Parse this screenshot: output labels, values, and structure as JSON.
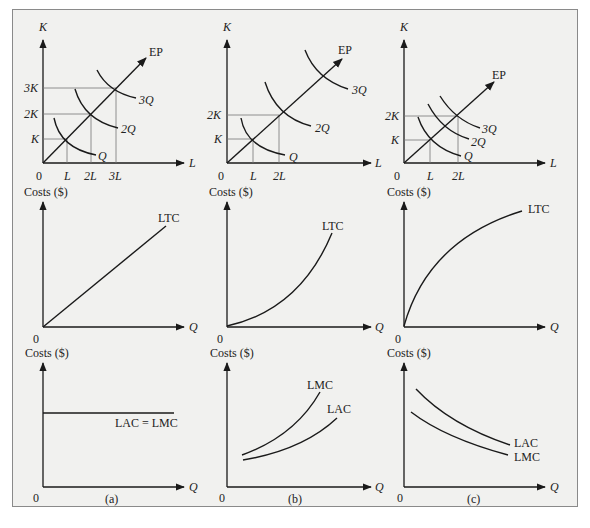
{
  "figure": {
    "panels": [
      {
        "id": "a",
        "caption": "(a)",
        "isoquant": {
          "y_axis": "K",
          "x_axis": "L",
          "origin": "0",
          "expansion_path": "EP",
          "isoquants": [
            "Q",
            "2Q",
            "3Q"
          ],
          "k_ticks": [
            "K",
            "2K",
            "3K"
          ],
          "l_ticks": [
            "L",
            "2L",
            "3L"
          ]
        },
        "ltc": {
          "y_axis": "Costs ($)",
          "x_axis": "Q",
          "origin": "0",
          "curve": "LTC"
        },
        "unit_cost": {
          "y_axis": "Costs ($)",
          "x_axis": "Q",
          "origin": "0",
          "curve": "LAC = LMC"
        }
      },
      {
        "id": "b",
        "caption": "(b)",
        "isoquant": {
          "y_axis": "K",
          "x_axis": "L",
          "origin": "0",
          "expansion_path": "EP",
          "isoquants": [
            "Q",
            "2Q",
            "3Q"
          ],
          "k_ticks": [
            "K",
            "2K"
          ],
          "l_ticks": [
            "L",
            "2L"
          ]
        },
        "ltc": {
          "y_axis": "Costs ($)",
          "x_axis": "Q",
          "origin": "0",
          "curve": "LTC"
        },
        "unit_cost": {
          "y_axis": "Costs ($)",
          "x_axis": "Q",
          "origin": "0",
          "curves": [
            "LMC",
            "LAC"
          ]
        }
      },
      {
        "id": "c",
        "caption": "(c)",
        "isoquant": {
          "y_axis": "K",
          "x_axis": "L",
          "origin": "0",
          "expansion_path": "EP",
          "isoquants": [
            "Q",
            "2Q",
            "3Q"
          ],
          "k_ticks": [
            "K",
            "2K"
          ],
          "l_ticks": [
            "L",
            "2L"
          ]
        },
        "ltc": {
          "y_axis": "Costs ($)",
          "x_axis": "Q",
          "origin": "0",
          "curve": "LTC"
        },
        "unit_cost": {
          "y_axis": "Costs ($)",
          "x_axis": "Q",
          "origin": "0",
          "curves": [
            "LAC",
            "LMC"
          ]
        }
      }
    ]
  },
  "colors": {
    "background": "#f1f1ef",
    "border": "#8a8a8a",
    "ink": "#1a1a1a"
  }
}
